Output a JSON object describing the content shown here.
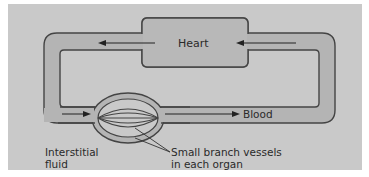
{
  "diagram": {
    "labels": {
      "heart": "Heart",
      "blood": "Blood",
      "interstitial_line1": "Interstitial",
      "interstitial_line2": "fluid",
      "vessels_line1": "Small branch vessels",
      "vessels_line2": "in each organ"
    },
    "colors": {
      "background": "#c9c9c9",
      "vessel_fill": "#b4b4b4",
      "outline": "#444444"
    }
  }
}
